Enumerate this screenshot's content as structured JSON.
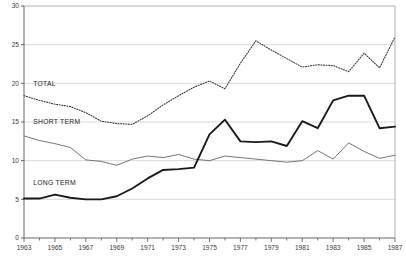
{
  "chart_data": {
    "type": "line",
    "title": "",
    "subtitle": "",
    "xlabel": "",
    "ylabel": "",
    "xlim": [
      1963,
      1987
    ],
    "ylim": [
      0,
      30
    ],
    "grid": true,
    "legend_position": "inline-annotations",
    "yticks": [
      0,
      5,
      10,
      15,
      20,
      25,
      30
    ],
    "ytick_labels": [
      "0",
      "5",
      "10",
      "15",
      "20",
      "25",
      "30"
    ],
    "xticks": [
      1963,
      1965,
      1967,
      1969,
      1971,
      1973,
      1975,
      1977,
      1979,
      1981,
      1983,
      1985,
      1987
    ],
    "xtick_labels": [
      "1963",
      "1965",
      "1967",
      "1969",
      "1971",
      "1973",
      "1975",
      "1977",
      "1979",
      "1981",
      "1983",
      "1985",
      "1987"
    ],
    "x": [
      1963,
      1964,
      1965,
      1966,
      1967,
      1968,
      1969,
      1970,
      1971,
      1972,
      1973,
      1974,
      1975,
      1976,
      1977,
      1978,
      1979,
      1980,
      1981,
      1982,
      1983,
      1984,
      1985,
      1986,
      1987
    ],
    "series": [
      {
        "name": "TOTAL",
        "style": "dotted",
        "color": "#333333",
        "values": [
          18.4,
          17.8,
          17.3,
          17.0,
          16.2,
          15.1,
          14.8,
          14.7,
          15.8,
          17.2,
          18.4,
          19.5,
          20.3,
          19.3,
          22.6,
          25.5,
          24.3,
          23.2,
          22.1,
          22.4,
          22.3,
          21.5,
          23.9,
          22.0,
          26.0
        ]
      },
      {
        "name": "SHORT TERM",
        "style": "solid-thin",
        "color": "#6e6e6e",
        "values": [
          13.2,
          12.6,
          12.2,
          11.7,
          10.1,
          9.9,
          9.4,
          10.2,
          10.6,
          10.4,
          10.8,
          10.2,
          10.0,
          10.6,
          10.4,
          10.2,
          10.0,
          9.8,
          10.0,
          11.3,
          10.2,
          12.3,
          11.2,
          10.3,
          10.7
        ]
      },
      {
        "name": "LONG TERM",
        "style": "solid-thick",
        "color": "#1a1a1a",
        "values": [
          5.1,
          5.1,
          5.6,
          5.2,
          5.0,
          5.0,
          5.4,
          6.4,
          7.7,
          8.8,
          8.9,
          9.1,
          13.4,
          15.3,
          12.5,
          12.4,
          12.5,
          11.9,
          15.1,
          14.2,
          17.8,
          18.4,
          18.4,
          14.2,
          14.4
        ]
      }
    ],
    "annotations": [
      {
        "label": "TOTAL",
        "x_value": 1963.6,
        "y_value": 19.6
      },
      {
        "label": "SHORT TERM",
        "x_value": 1963.6,
        "y_value": 14.8
      },
      {
        "label": "LONG TERM",
        "x_value": 1963.6,
        "y_value": 6.8
      }
    ]
  },
  "caption": {
    "text": ""
  }
}
